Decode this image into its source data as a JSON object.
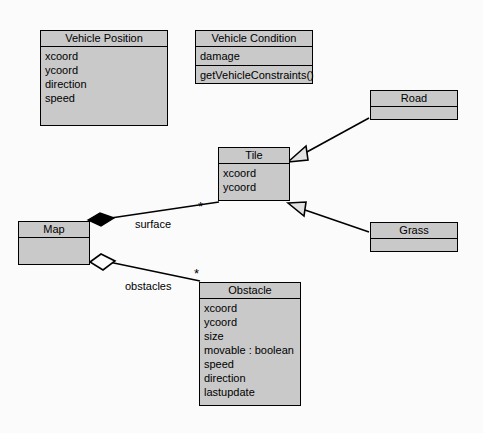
{
  "diagram": {
    "background_color": "#fbfbfb",
    "class_fill_color": "#c9c9c9",
    "line_color": "#000000",
    "classes": [
      {
        "id": "vehicle-position",
        "name": "Vehicle Position",
        "attributes": [
          "xcoord",
          "ycoord",
          "direction",
          "speed"
        ],
        "operations": []
      },
      {
        "id": "vehicle-condition",
        "name": "Vehicle Condition",
        "attributes": [
          "damage"
        ],
        "operations": [
          "getVehicleConstraints()"
        ]
      },
      {
        "id": "road",
        "name": "Road",
        "attributes": [],
        "operations": []
      },
      {
        "id": "tile",
        "name": "Tile",
        "attributes": [
          "xcoord",
          "ycoord"
        ],
        "operations": []
      },
      {
        "id": "grass",
        "name": "Grass",
        "attributes": [],
        "operations": []
      },
      {
        "id": "map",
        "name": "Map",
        "attributes": [],
        "operations": []
      },
      {
        "id": "obstacle",
        "name": "Obstacle",
        "attributes": [
          "xcoord",
          "ycoord",
          "size",
          "movable : boolean",
          "speed",
          "direction",
          "lastupdate"
        ],
        "operations": []
      }
    ],
    "relationships": [
      {
        "id": "road-tile",
        "type": "generalization",
        "from": "Road",
        "to": "Tile",
        "label": "",
        "marker": "hollow-triangle"
      },
      {
        "id": "grass-tile",
        "type": "generalization",
        "from": "Grass",
        "to": "Tile",
        "label": "",
        "marker": "hollow-triangle"
      },
      {
        "id": "map-tile",
        "type": "composition",
        "from": "Map",
        "to": "Tile",
        "label": "surface",
        "multiplicity": "*",
        "marker": "filled-diamond"
      },
      {
        "id": "map-obstacle",
        "type": "aggregation",
        "from": "Map",
        "to": "Obstacle",
        "label": "obstacles",
        "multiplicity": "*",
        "marker": "hollow-diamond"
      }
    ],
    "labels": {
      "surface": "surface",
      "obstacles": "obstacles",
      "multiplicity_tile": "*",
      "multiplicity_obstacle": "*"
    }
  }
}
